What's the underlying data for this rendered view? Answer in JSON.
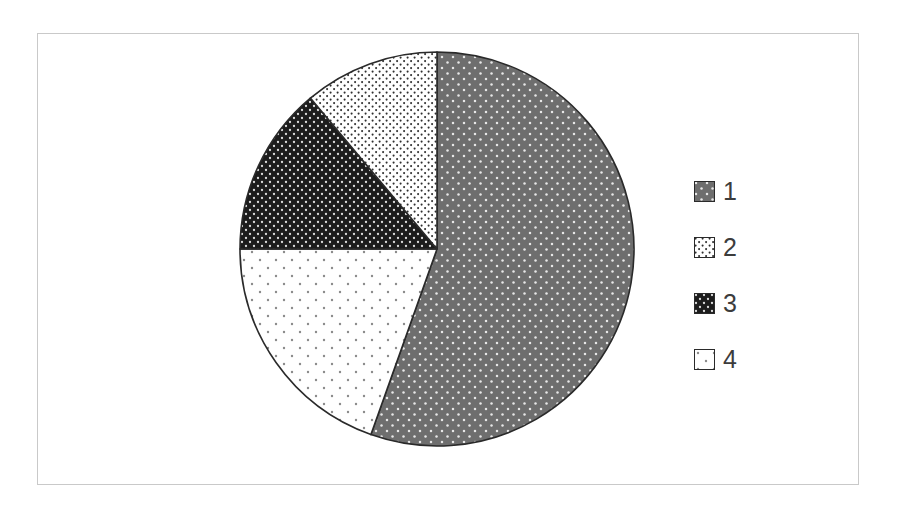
{
  "chart_data": {
    "type": "pie",
    "title": "",
    "subtitle": "",
    "xlabel": "",
    "ylabel": "",
    "grid": false,
    "legend_position": "right",
    "categories": [
      "1",
      "2",
      "3",
      "4"
    ],
    "values": [
      55.4,
      11.1,
      13.9,
      19.6
    ],
    "units": "percent",
    "start_angle_deg": 0,
    "direction": "clockwise",
    "slices": [
      {
        "label": "1",
        "value": 55.4,
        "start_angle_deg": 0,
        "end_angle_deg": 199.6,
        "fill": "#6e6e6e",
        "pattern": "dense-white-dots",
        "stroke": "#2a2a2a"
      },
      {
        "label": "2",
        "value": 11.1,
        "start_angle_deg": 320.0,
        "end_angle_deg": 360.0,
        "fill": "#ffffff",
        "pattern": "fine-dark-dots",
        "stroke": "#2a2a2a"
      },
      {
        "label": "3",
        "value": 13.9,
        "start_angle_deg": 270.0,
        "end_angle_deg": 320.0,
        "fill": "#1c1c1c",
        "pattern": "dark-with-white-dots",
        "stroke": "#2a2a2a"
      },
      {
        "label": "4",
        "value": 19.6,
        "start_angle_deg": 199.6,
        "end_angle_deg": 270.0,
        "fill": "#ffffff",
        "pattern": "sparse-gray-dots",
        "stroke": "#2a2a2a"
      }
    ],
    "geometry": {
      "center_x": 437,
      "center_y": 249,
      "radius": 197
    }
  },
  "legend": {
    "items": [
      {
        "label": "1",
        "swatch_name": "legend-swatch-series-1"
      },
      {
        "label": "2",
        "swatch_name": "legend-swatch-series-2"
      },
      {
        "label": "3",
        "swatch_name": "legend-swatch-series-3"
      },
      {
        "label": "4",
        "swatch_name": "legend-swatch-series-4"
      }
    ]
  },
  "colors": {
    "frame_border": "#c9c9c9",
    "background": "#ffffff",
    "slice_outline": "#2a2a2a",
    "label_text": "#3c3c3c"
  }
}
